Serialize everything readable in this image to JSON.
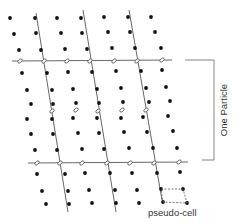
{
  "figure": {
    "labels": {
      "bracket": "One Particle",
      "cell": "pseudo-cell"
    },
    "colors": {
      "dot": "#111111",
      "line": "#555555",
      "background": "#ffffff"
    },
    "lattice_dots": [
      [
        10,
        18
      ],
      [
        35,
        18
      ],
      [
        57,
        18
      ],
      [
        81,
        18
      ],
      [
        104,
        17
      ],
      [
        128,
        17
      ],
      [
        151,
        17
      ],
      [
        14,
        34
      ],
      [
        36,
        33
      ],
      [
        61,
        33
      ],
      [
        82,
        33
      ],
      [
        108,
        32
      ],
      [
        130,
        32
      ],
      [
        155,
        32
      ],
      [
        19,
        50
      ],
      [
        41,
        50
      ],
      [
        65,
        49
      ],
      [
        87,
        49
      ],
      [
        112,
        48
      ],
      [
        135,
        48
      ],
      [
        161,
        48
      ],
      [
        22,
        73
      ],
      [
        47,
        73
      ],
      [
        68,
        72
      ],
      [
        92,
        72
      ],
      [
        116,
        71
      ],
      [
        141,
        71
      ],
      [
        162,
        70
      ],
      [
        27,
        90
      ],
      [
        52,
        90
      ],
      [
        73,
        89
      ],
      [
        97,
        89
      ],
      [
        121,
        88
      ],
      [
        146,
        88
      ],
      [
        166,
        87
      ],
      [
        31,
        104
      ],
      [
        53,
        104
      ],
      [
        76,
        103
      ],
      [
        99,
        103
      ],
      [
        123,
        102
      ],
      [
        149,
        102
      ],
      [
        170,
        101
      ],
      [
        27,
        119
      ],
      [
        52,
        119
      ],
      [
        73,
        118
      ],
      [
        97,
        118
      ],
      [
        121,
        118
      ],
      [
        143,
        117
      ],
      [
        168,
        116
      ],
      [
        31,
        134
      ],
      [
        53,
        134
      ],
      [
        78,
        133
      ],
      [
        99,
        133
      ],
      [
        124,
        132
      ],
      [
        147,
        132
      ],
      [
        173,
        131
      ],
      [
        35,
        150
      ],
      [
        57,
        150
      ],
      [
        82,
        149
      ],
      [
        104,
        149
      ],
      [
        129,
        148
      ],
      [
        153,
        148
      ],
      [
        177,
        148
      ],
      [
        37,
        174
      ],
      [
        65,
        174
      ],
      [
        85,
        173
      ],
      [
        110,
        173
      ],
      [
        132,
        173
      ],
      [
        157,
        173
      ],
      [
        180,
        172
      ],
      [
        42,
        191
      ],
      [
        68,
        191
      ],
      [
        89,
        190
      ],
      [
        115,
        190
      ],
      [
        137,
        190
      ],
      [
        161,
        189
      ],
      [
        183,
        189
      ],
      [
        46,
        204
      ],
      [
        69,
        204
      ],
      [
        92,
        203
      ],
      [
        116,
        203
      ],
      [
        139,
        203
      ],
      [
        163,
        202
      ],
      [
        187,
        203
      ]
    ],
    "ellipses": [
      [
        20,
        61
      ],
      [
        44,
        61
      ],
      [
        67,
        61
      ],
      [
        90,
        61
      ],
      [
        114,
        61
      ],
      [
        137,
        61
      ],
      [
        162,
        60
      ],
      [
        52,
        111
      ],
      [
        76,
        110
      ],
      [
        98,
        111
      ],
      [
        122,
        110
      ],
      [
        146,
        110
      ],
      [
        37,
        163
      ],
      [
        60,
        163
      ],
      [
        82,
        163
      ],
      [
        107,
        163
      ],
      [
        130,
        163
      ],
      [
        154,
        163
      ],
      [
        179,
        162
      ]
    ],
    "horizontal_lines": [
      {
        "x1": 12,
        "y1": 61,
        "x2": 172,
        "y2": 60
      },
      {
        "x1": 28,
        "y1": 163,
        "x2": 188,
        "y2": 162
      }
    ],
    "slanted_lines": [
      {
        "x1": 36,
        "y1": 13,
        "x2": 68,
        "y2": 212
      },
      {
        "x1": 83,
        "y1": 10,
        "x2": 116,
        "y2": 212
      },
      {
        "x1": 129,
        "y1": 10,
        "x2": 162,
        "y2": 200
      }
    ],
    "bracket": {
      "top_y": 60,
      "bottom_y": 160,
      "left_top_x": 185,
      "left_bottom_x": 202,
      "right_x": 214
    },
    "pseudo_cell": [
      [
        161,
        189
      ],
      [
        183,
        189
      ],
      [
        187,
        203
      ],
      [
        163,
        202
      ]
    ]
  }
}
